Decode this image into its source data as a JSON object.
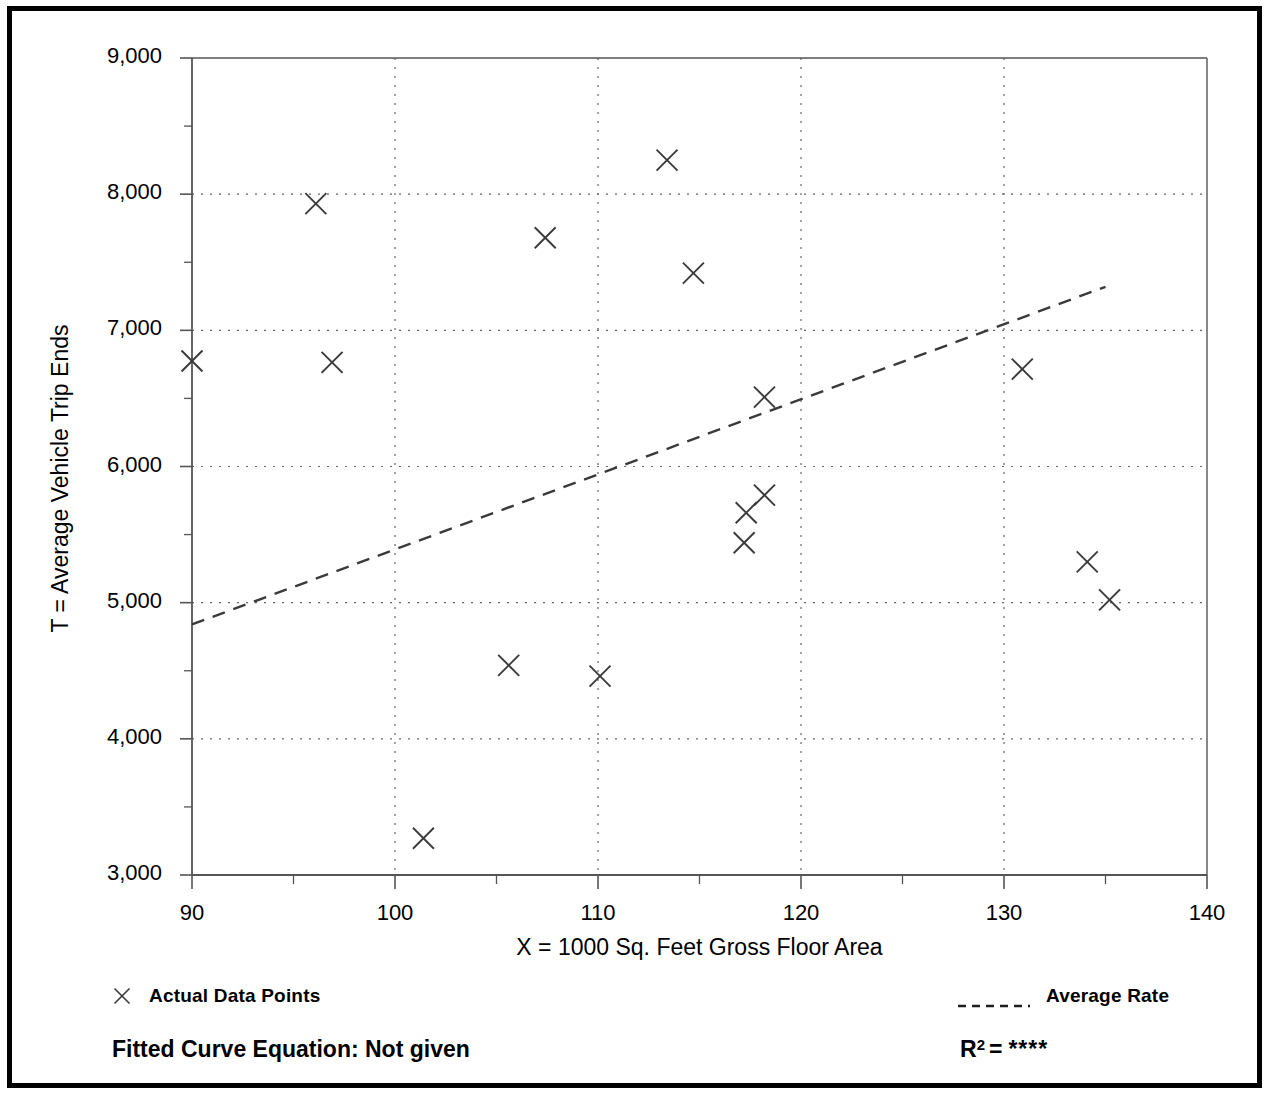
{
  "chart_data": {
    "type": "scatter",
    "title": "",
    "xlabel": "X = 1000 Sq. Feet Gross Floor Area",
    "ylabel": "T = Average Vehicle Trip Ends",
    "xlim": [
      90,
      140
    ],
    "ylim": [
      3000,
      9000
    ],
    "xticks": [
      90,
      100,
      110,
      120,
      130,
      140
    ],
    "xtick_labels": [
      "90",
      "100",
      "110",
      "120",
      "130",
      "140"
    ],
    "yticks": [
      3000,
      4000,
      5000,
      6000,
      7000,
      8000,
      9000
    ],
    "ytick_labels": [
      "3,000",
      "4,000",
      "5,000",
      "6,000",
      "7,000",
      "8,000",
      "9,000"
    ],
    "xminor_ticks": [
      95,
      105,
      115,
      125,
      135
    ],
    "yminor_ticks": [
      3500,
      4500,
      5500,
      6500,
      7500,
      8500
    ],
    "grid": "dotted major gridlines both axes",
    "series": [
      {
        "name": "Actual Data Points",
        "marker": "x",
        "points": [
          {
            "x": 90.0,
            "y": 6775
          },
          {
            "x": 96.1,
            "y": 7930
          },
          {
            "x": 96.9,
            "y": 6765
          },
          {
            "x": 101.4,
            "y": 3270
          },
          {
            "x": 105.6,
            "y": 4540
          },
          {
            "x": 107.4,
            "y": 7680
          },
          {
            "x": 110.1,
            "y": 4460
          },
          {
            "x": 113.4,
            "y": 8250
          },
          {
            "x": 114.7,
            "y": 7420
          },
          {
            "x": 117.2,
            "y": 5440
          },
          {
            "x": 117.3,
            "y": 5660
          },
          {
            "x": 118.2,
            "y": 5790
          },
          {
            "x": 118.2,
            "y": 6510
          },
          {
            "x": 130.9,
            "y": 6715
          },
          {
            "x": 134.1,
            "y": 5300
          },
          {
            "x": 135.2,
            "y": 5020
          }
        ]
      },
      {
        "name": "Average Rate",
        "style": "dashed-line",
        "points": [
          {
            "x": 90.0,
            "y": 4840
          },
          {
            "x": 135.0,
            "y": 7320
          }
        ]
      }
    ]
  },
  "legend": {
    "actual_label": "Actual Data Points",
    "actual_marker": "x-marker-icon",
    "average_label": "Average Rate",
    "average_marker": "dashed-line-icon"
  },
  "footer": {
    "fitted_curve_label": "Fitted Curve Equation:  Not given",
    "r2_label": "R",
    "r2_exponent": "2",
    "r2_equals": "=",
    "r2_value": "****"
  },
  "colors": {
    "frame": "#000000",
    "axis": "#555555",
    "grid": "#666666",
    "marker": "#3a3a3a",
    "trend": "#3a3a3a",
    "text": "#000000"
  }
}
